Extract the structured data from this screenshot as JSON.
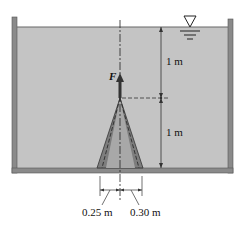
{
  "diagram": {
    "type": "fluid-statics",
    "labels": {
      "force": "F",
      "upper_depth": "1 m",
      "lower_depth": "1 m",
      "left_base_radius": "0.25 m",
      "right_base_radius": "0.30 m"
    },
    "symbols": {
      "free_surface": "free-surface-triangle"
    },
    "colors": {
      "water": "#c4c4c4",
      "wall": "#8a8a8a",
      "cone_outer": "#7d7d7d",
      "cone_inner": "#a8a8a8",
      "force_arrow": "#333333"
    }
  }
}
